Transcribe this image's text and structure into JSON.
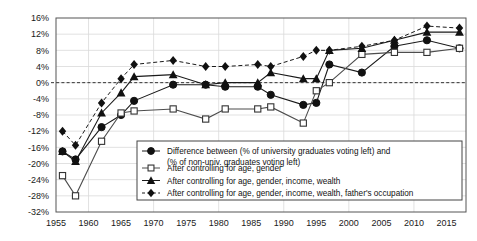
{
  "chart_data": {
    "type": "line",
    "title": "",
    "subtitle": "",
    "xlabel": "",
    "ylabel": "",
    "xlim": [
      1955,
      2018
    ],
    "ylim": [
      -32,
      16
    ],
    "ytick_step": 4,
    "xtick_step": 5,
    "grid": true,
    "zero_line": true,
    "legend_position": "inside-bottom-center",
    "y_tick_labels": [
      "16%",
      "12%",
      "8%",
      "4%",
      "0%",
      "-4%",
      "-8%",
      "-12%",
      "-16%",
      "-20%",
      "-24%",
      "-28%",
      "-32%"
    ],
    "y_tick_values": [
      16,
      12,
      8,
      4,
      0,
      -4,
      -8,
      -12,
      -16,
      -20,
      -24,
      -28,
      -32
    ],
    "x_tick_labels": [
      "1955",
      "1960",
      "1965",
      "1970",
      "1975",
      "1980",
      "1985",
      "1990",
      "1995",
      "2000",
      "2005",
      "2010",
      "2015"
    ],
    "x_tick_values": [
      1955,
      1960,
      1965,
      1970,
      1975,
      1980,
      1985,
      1990,
      1995,
      2000,
      2005,
      2010,
      2015
    ],
    "series": [
      {
        "name": "Difference between (% of university graduates voting left) and (% of non-univ. graduates voting left)",
        "marker": "circle-filled",
        "line": "solid",
        "color": "#1a1a1a",
        "x": [
          1956,
          1958,
          1962,
          1965,
          1967,
          1973,
          1978,
          1981,
          1986,
          1988,
          1993,
          1995,
          1997,
          2002,
          2007,
          2012,
          2017
        ],
        "y": [
          -17.0,
          -19.0,
          -11.0,
          -8.0,
          -4.5,
          -0.5,
          -0.5,
          -1.0,
          -1.0,
          -3.0,
          -5.5,
          -5.0,
          4.5,
          2.5,
          9.0,
          10.5,
          8.5
        ]
      },
      {
        "name": "After controlling for age, gender",
        "marker": "square-open",
        "line": "solid",
        "color": "#4d4d4d",
        "x": [
          1956,
          1958,
          1962,
          1965,
          1967,
          1973,
          1978,
          1981,
          1986,
          1988,
          1993,
          1995,
          1997,
          2002,
          2007,
          2012,
          2017
        ],
        "y": [
          -23.0,
          -28.0,
          -14.5,
          -7.5,
          -7.0,
          -6.5,
          -9.0,
          -6.5,
          -6.5,
          -6.0,
          -10.0,
          -2.0,
          0.0,
          7.0,
          7.5,
          7.5,
          8.5
        ]
      },
      {
        "name": "After controlling for age, gender, income, wealth",
        "marker": "triangle-filled",
        "line": "solid",
        "color": "#1a1a1a",
        "x": [
          1956,
          1958,
          1962,
          1965,
          1967,
          1973,
          1978,
          1981,
          1986,
          1988,
          1993,
          1995,
          1997,
          2002,
          2007,
          2012,
          2017
        ],
        "y": [
          -17.0,
          -19.5,
          -7.5,
          -2.5,
          1.5,
          2.0,
          -0.5,
          0.0,
          0.0,
          2.5,
          1.0,
          1.0,
          8.0,
          8.5,
          10.5,
          12.5,
          12.5
        ]
      },
      {
        "name": "After controlling for age, gender, income, wealth, father's occupation",
        "marker": "diamond-filled",
        "line": "dashed",
        "color": "#1a1a1a",
        "x": [
          1956,
          1958,
          1962,
          1965,
          1967,
          1973,
          1978,
          1981,
          1986,
          1988,
          1993,
          1995,
          1997,
          2002,
          2007,
          2012,
          2017
        ],
        "y": [
          -12.0,
          -15.5,
          -5.0,
          1.0,
          4.5,
          5.5,
          4.0,
          4.0,
          4.5,
          4.0,
          6.5,
          8.0,
          8.0,
          9.0,
          10.5,
          14.0,
          13.5
        ]
      }
    ]
  },
  "legend": {
    "entries": [
      {
        "label_line1": "Difference between (% of university graduates voting left) and",
        "label_line2": "(% of non-univ. graduates voting left)",
        "marker": "circle-filled"
      },
      {
        "label_line1": "After controlling for age, gender",
        "label_line2": "",
        "marker": "square-open"
      },
      {
        "label_line1": "After controlling for age, gender, income, wealth",
        "label_line2": "",
        "marker": "triangle-filled"
      },
      {
        "label_line1": "After controlling for age, gender, income, wealth, father's occupation",
        "label_line2": "",
        "marker": "diamond-filled"
      }
    ]
  },
  "colors": {
    "axis": "#555555",
    "grid": "#d9d9d9",
    "series_dark": "#1a1a1a",
    "series_gray": "#4d4d4d",
    "background": "#ffffff"
  }
}
